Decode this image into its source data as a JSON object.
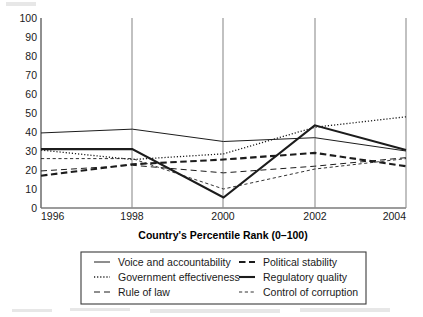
{
  "chart_data": {
    "type": "line",
    "title": "",
    "xlabel": "Country's Percentile Rank (0–100)",
    "ylabel": "",
    "x": [
      1996,
      1998,
      2000,
      2002,
      2004
    ],
    "xtick_labels": [
      "1996",
      "1998",
      "2000",
      "2002",
      "2004"
    ],
    "ytick_labels": [
      "0",
      "10",
      "20",
      "30",
      "40",
      "50",
      "60",
      "70",
      "80",
      "90",
      "100"
    ],
    "yticks": [
      0,
      10,
      20,
      30,
      40,
      50,
      60,
      70,
      80,
      90,
      100
    ],
    "ylim": [
      0,
      100
    ],
    "xlim": [
      1996,
      2004
    ],
    "grid": "vertical-only",
    "legend_position": "below-plot",
    "series": [
      {
        "name": "Voice and accountability",
        "style": "solid-thin",
        "values": [
          39.5,
          41.5,
          35.0,
          37.0,
          30.0
        ]
      },
      {
        "name": "Government effectiveness",
        "style": "dotted",
        "values": [
          30.5,
          25.5,
          28.5,
          42.5,
          48.0
        ]
      },
      {
        "name": "Rule of law",
        "style": "long-dash",
        "values": [
          19.5,
          22.5,
          18.5,
          22.0,
          26.5
        ]
      },
      {
        "name": "Political stability",
        "style": "thick-dash",
        "values": [
          17.0,
          23.0,
          25.5,
          29.0,
          22.0
        ]
      },
      {
        "name": "Regulatory quality",
        "style": "solid-thick",
        "values": [
          31.0,
          31.0,
          5.5,
          43.5,
          30.5
        ]
      },
      {
        "name": "Control of corruption",
        "style": "short-dash-thin",
        "values": [
          26.0,
          26.0,
          10.0,
          20.5,
          26.0
        ]
      }
    ]
  },
  "legend": {
    "entries": [
      {
        "label": "Voice and accountability",
        "sample": "solid-thin"
      },
      {
        "label": "Government effectiveness",
        "sample": "dotted"
      },
      {
        "label": "Rule of law",
        "sample": "long-dash"
      },
      {
        "label": "Political stability",
        "sample": "thick-dash"
      },
      {
        "label": "Regulatory quality",
        "sample": "solid-thick"
      },
      {
        "label": "Control of corruption",
        "sample": "short-dash-thin"
      }
    ]
  },
  "colors": {
    "line": "#1c1c1c",
    "axis": "#3b3b3b",
    "gridline": "#8e8e8e",
    "background": "#ffffff",
    "text": "#1a1a1a"
  }
}
